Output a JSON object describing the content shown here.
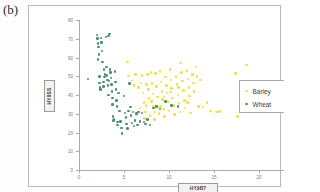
{
  "panel": {
    "letter": "(b)"
  },
  "chart_data": {
    "type": "scatter",
    "title": "",
    "xlabel": "HY9B7",
    "ylabel": "HY9SS",
    "xlim": [
      0,
      25
    ],
    "ylim": [
      0,
      80
    ],
    "xticks": [
      0,
      5,
      10,
      15,
      20,
      25
    ],
    "yticks": [
      0,
      10,
      20,
      30,
      40,
      50,
      60,
      70,
      80
    ],
    "grid": false,
    "legend_position": "right",
    "colors": {
      "barley": "#f2e03c",
      "wheat": "#4b8c77"
    },
    "series": [
      {
        "name": "Barley",
        "color": "#f2e03c",
        "points": [
          [
            5.4,
            57.5
          ],
          [
            5.5,
            50.2
          ],
          [
            5.9,
            47.5
          ],
          [
            6.1,
            45.0
          ],
          [
            6.3,
            51.0
          ],
          [
            6.6,
            44.0
          ],
          [
            6.8,
            33.0
          ],
          [
            7.0,
            50.5
          ],
          [
            7.1,
            41.0
          ],
          [
            7.2,
            36.0
          ],
          [
            7.3,
            27.5
          ],
          [
            7.4,
            31.0
          ],
          [
            7.5,
            45.5
          ],
          [
            7.6,
            50.8
          ],
          [
            7.7,
            43.0
          ],
          [
            7.8,
            38.0
          ],
          [
            7.9,
            29.0
          ],
          [
            8.0,
            52.0
          ],
          [
            8.1,
            46.0
          ],
          [
            8.2,
            40.5
          ],
          [
            8.3,
            34.0
          ],
          [
            8.4,
            27.0
          ],
          [
            8.5,
            51.5
          ],
          [
            8.6,
            44.5
          ],
          [
            8.7,
            39.0
          ],
          [
            8.8,
            33.5
          ],
          [
            8.9,
            30.0
          ],
          [
            9.0,
            52.5
          ],
          [
            9.1,
            47.0
          ],
          [
            9.2,
            42.0
          ],
          [
            9.3,
            37.5
          ],
          [
            9.4,
            32.5
          ],
          [
            9.5,
            28.5
          ],
          [
            9.6,
            49.5
          ],
          [
            9.7,
            45.0
          ],
          [
            9.8,
            41.0
          ],
          [
            9.9,
            36.5
          ],
          [
            10.0,
            31.5
          ],
          [
            10.1,
            53.5
          ],
          [
            10.2,
            48.0
          ],
          [
            10.3,
            43.5
          ],
          [
            10.4,
            38.5
          ],
          [
            10.5,
            34.5
          ],
          [
            10.6,
            29.5
          ],
          [
            10.8,
            50.0
          ],
          [
            10.9,
            45.5
          ],
          [
            11.0,
            40.0
          ],
          [
            11.1,
            35.5
          ],
          [
            11.2,
            31.0
          ],
          [
            11.3,
            57.0
          ],
          [
            11.4,
            52.0
          ],
          [
            11.5,
            47.5
          ],
          [
            11.6,
            42.5
          ],
          [
            11.7,
            37.0
          ],
          [
            11.8,
            33.0
          ],
          [
            12.0,
            53.0
          ],
          [
            12.1,
            48.5
          ],
          [
            12.2,
            44.0
          ],
          [
            12.3,
            39.5
          ],
          [
            12.4,
            30.5
          ],
          [
            12.6,
            51.0
          ],
          [
            12.7,
            46.5
          ],
          [
            12.8,
            42.0
          ],
          [
            13.0,
            55.0
          ],
          [
            13.1,
            50.0
          ],
          [
            13.3,
            34.0
          ],
          [
            13.5,
            48.0
          ],
          [
            13.8,
            33.5
          ],
          [
            14.2,
            36.0
          ],
          [
            14.6,
            31.5
          ],
          [
            15.3,
            31.0
          ],
          [
            15.6,
            31.2
          ],
          [
            17.4,
            51.5
          ],
          [
            17.6,
            28.5
          ],
          [
            18.6,
            56.0
          ],
          [
            6.4,
            29.5
          ],
          [
            6.9,
            46.5
          ],
          [
            8.05,
            36.5
          ],
          [
            9.05,
            34.0
          ],
          [
            10.15,
            41.5
          ],
          [
            11.05,
            44.0
          ],
          [
            12.05,
            36.0
          ],
          [
            7.45,
            34.5
          ],
          [
            8.45,
            31.0
          ],
          [
            9.45,
            39.0
          ]
        ]
      },
      {
        "name": "Wheat",
        "color": "#4b8c77",
        "points": [
          [
            1.0,
            48.5
          ],
          [
            2.0,
            72.0
          ],
          [
            2.05,
            70.0
          ],
          [
            2.1,
            67.5
          ],
          [
            2.15,
            65.5
          ],
          [
            2.2,
            61.5
          ],
          [
            2.25,
            50.0
          ],
          [
            2.3,
            46.5
          ],
          [
            2.35,
            44.0
          ],
          [
            2.4,
            43.0
          ],
          [
            2.45,
            70.5
          ],
          [
            2.5,
            68.0
          ],
          [
            2.6,
            57.5
          ],
          [
            2.7,
            47.0
          ],
          [
            2.75,
            44.5
          ],
          [
            2.8,
            53.5
          ],
          [
            2.9,
            51.0
          ],
          [
            3.0,
            71.0
          ],
          [
            3.05,
            55.0
          ],
          [
            3.1,
            50.5
          ],
          [
            3.15,
            48.0
          ],
          [
            3.2,
            45.0
          ],
          [
            3.3,
            71.5
          ],
          [
            3.4,
            72.5
          ],
          [
            3.45,
            53.5
          ],
          [
            3.5,
            52.0
          ],
          [
            3.55,
            49.0
          ],
          [
            3.6,
            45.5
          ],
          [
            3.65,
            42.0
          ],
          [
            3.7,
            38.5
          ],
          [
            3.75,
            35.0
          ],
          [
            3.8,
            28.5
          ],
          [
            3.85,
            26.5
          ],
          [
            3.9,
            27.0
          ],
          [
            4.0,
            52.5
          ],
          [
            4.05,
            47.0
          ],
          [
            4.1,
            43.0
          ],
          [
            4.2,
            34.0
          ],
          [
            4.25,
            25.5
          ],
          [
            4.3,
            24.0
          ],
          [
            4.4,
            41.0
          ],
          [
            4.5,
            31.5
          ],
          [
            4.6,
            26.0
          ],
          [
            4.7,
            22.5
          ],
          [
            4.8,
            19.5
          ],
          [
            5.0,
            39.5
          ],
          [
            5.1,
            30.5
          ],
          [
            5.2,
            28.0
          ],
          [
            5.3,
            24.5
          ],
          [
            5.4,
            22.0
          ],
          [
            5.6,
            46.0
          ],
          [
            5.7,
            33.5
          ],
          [
            5.8,
            29.0
          ],
          [
            5.9,
            25.0
          ],
          [
            6.0,
            31.0
          ],
          [
            6.1,
            23.5
          ],
          [
            6.2,
            26.5
          ],
          [
            6.4,
            30.0
          ],
          [
            6.5,
            24.0
          ],
          [
            6.8,
            26.0
          ],
          [
            7.0,
            30.5
          ],
          [
            7.2,
            25.5
          ],
          [
            7.4,
            24.5
          ],
          [
            7.6,
            27.0
          ],
          [
            7.9,
            24.0
          ],
          [
            8.3,
            33.0
          ],
          [
            8.6,
            34.0
          ],
          [
            9.0,
            32.5
          ],
          [
            9.6,
            36.5
          ],
          [
            10.3,
            34.5
          ],
          [
            11.0,
            34.0
          ],
          [
            2.85,
            49.5
          ],
          [
            3.25,
            40.0
          ],
          [
            4.15,
            37.0
          ],
          [
            5.5,
            31.5
          ],
          [
            6.6,
            31.0
          ],
          [
            3.35,
            47.5
          ],
          [
            2.55,
            63.5
          ],
          [
            2.12,
            59.0
          ]
        ]
      }
    ]
  },
  "legend": {
    "items": [
      {
        "label": "Barley",
        "color": "#f2e03c"
      },
      {
        "label": "Wheat",
        "color": "#4b8c77"
      }
    ]
  }
}
